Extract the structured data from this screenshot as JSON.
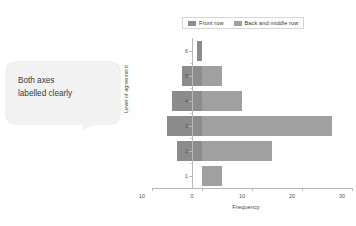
{
  "annotation": {
    "text": "Both axes\nlabelled clearly"
  },
  "colors": {
    "front_row": "#8c8c8c",
    "back_middle_row": "#a0a0a0",
    "axis": "#b9b9b9",
    "text": "#4a4a4a",
    "bubble_bg": "#f2f2f2"
  },
  "chart_data": {
    "type": "bar",
    "orientation": "horizontal-diverging",
    "title": "",
    "xlabel": "Frequency",
    "ylabel": "Level of agreement",
    "categories": [
      1,
      2,
      3,
      4,
      5,
      6
    ],
    "xlim": [
      -10,
      30
    ],
    "xticks": [
      -10,
      0,
      10,
      20,
      30
    ],
    "xtick_labels": [
      "10",
      "0",
      "10",
      "20",
      "30"
    ],
    "yticks": [
      1,
      2,
      3,
      4,
      5,
      6
    ],
    "ytick_labels": [
      "1",
      "2",
      "3",
      "4",
      "5",
      "6"
    ],
    "grid": false,
    "legend_position": "top",
    "series": [
      {
        "name": "Front row",
        "color": "#8c8c8c",
        "direction": "left",
        "values": [
          0,
          5,
          7,
          6,
          4,
          1
        ]
      },
      {
        "name": "Back and middle row",
        "color": "#a0a0a0",
        "direction": "right",
        "values": [
          4,
          14,
          26,
          8,
          4,
          0
        ]
      }
    ]
  },
  "legend": {
    "items": [
      {
        "label": "Front row",
        "color": "#8c8c8c"
      },
      {
        "label": "Back and middle row",
        "color": "#a0a0a0"
      }
    ]
  }
}
